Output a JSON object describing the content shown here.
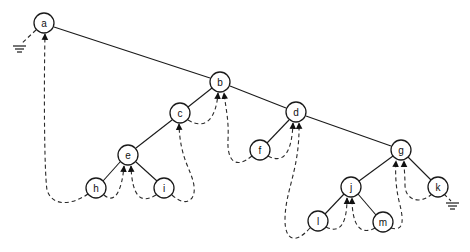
{
  "diagram": {
    "type": "threaded-binary-tree",
    "nodes": [
      {
        "id": "a",
        "label": "a",
        "x": 44,
        "y": 23
      },
      {
        "id": "b",
        "label": "b",
        "x": 220,
        "y": 82
      },
      {
        "id": "c",
        "label": "c",
        "x": 180,
        "y": 113
      },
      {
        "id": "d",
        "label": "d",
        "x": 296,
        "y": 112
      },
      {
        "id": "e",
        "label": "e",
        "x": 128,
        "y": 155
      },
      {
        "id": "f",
        "label": "f",
        "x": 260,
        "y": 150
      },
      {
        "id": "g",
        "label": "g",
        "x": 401,
        "y": 150
      },
      {
        "id": "h",
        "label": "h",
        "x": 96,
        "y": 188
      },
      {
        "id": "i",
        "label": "i",
        "x": 164,
        "y": 188
      },
      {
        "id": "j",
        "label": "j",
        "x": 351,
        "y": 187
      },
      {
        "id": "k",
        "label": "k",
        "x": 438,
        "y": 187
      },
      {
        "id": "l",
        "label": "l",
        "x": 318,
        "y": 221
      },
      {
        "id": "m",
        "label": "m",
        "x": 383,
        "y": 222
      }
    ],
    "edges": [
      {
        "from": "a",
        "to": "b"
      },
      {
        "from": "b",
        "to": "c"
      },
      {
        "from": "b",
        "to": "d"
      },
      {
        "from": "c",
        "to": "e"
      },
      {
        "from": "e",
        "to": "h"
      },
      {
        "from": "e",
        "to": "i"
      },
      {
        "from": "d",
        "to": "f"
      },
      {
        "from": "d",
        "to": "g"
      },
      {
        "from": "g",
        "to": "j"
      },
      {
        "from": "g",
        "to": "k"
      },
      {
        "from": "j",
        "to": "l"
      },
      {
        "from": "j",
        "to": "m"
      }
    ],
    "threads": [
      {
        "from": "h",
        "to": "a",
        "style": "dashed-arrow"
      },
      {
        "from": "h",
        "to": "e",
        "style": "dashed-arrow"
      },
      {
        "from": "i",
        "to": "e",
        "style": "dashed-arrow"
      },
      {
        "from": "i",
        "to": "c",
        "style": "dashed-arrow"
      },
      {
        "from": "c",
        "to": "b",
        "style": "dashed-arrow"
      },
      {
        "from": "f",
        "to": "b",
        "style": "dashed-arrow"
      },
      {
        "from": "f",
        "to": "d",
        "style": "dashed-arrow"
      },
      {
        "from": "l",
        "to": "d",
        "style": "dashed-arrow"
      },
      {
        "from": "l",
        "to": "j",
        "style": "dashed-arrow"
      },
      {
        "from": "m",
        "to": "j",
        "style": "dashed-arrow"
      },
      {
        "from": "m",
        "to": "g",
        "style": "dashed-arrow"
      },
      {
        "from": "k",
        "to": "g",
        "style": "dashed-arrow"
      }
    ],
    "null_links": [
      {
        "from": "a",
        "symbol": "ground"
      },
      {
        "from": "k",
        "symbol": "ground"
      }
    ]
  }
}
